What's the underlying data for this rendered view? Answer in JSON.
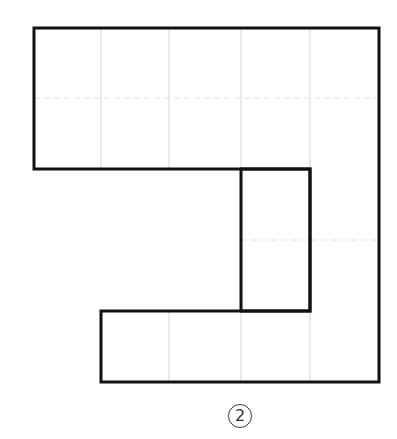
{
  "figure": {
    "label": "2",
    "grid": {
      "cell_width": 69,
      "cell_height": 71,
      "columns": 5,
      "rows": 5,
      "origin": [
        34,
        28
      ],
      "line_color": "#d0d0d0"
    },
    "outline_color": "#111111",
    "shape_outline_points": [
      [
        34,
        28
      ],
      [
        379,
        28
      ],
      [
        379,
        382
      ],
      [
        101,
        382
      ],
      [
        101,
        311
      ],
      [
        310,
        311
      ],
      [
        310,
        169
      ],
      [
        34,
        169
      ]
    ],
    "inner_rectangle": {
      "x": 241,
      "y": 169,
      "width": 69,
      "height": 142
    }
  }
}
